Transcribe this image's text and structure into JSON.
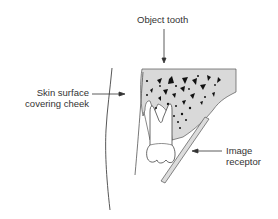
{
  "diagram": {
    "labels": {
      "object_tooth": "Object tooth",
      "skin_surface_line1": "Skin surface",
      "skin_surface_line2": "covering cheek",
      "image_receptor_line1": "Image",
      "image_receptor_line2": "receptor"
    },
    "colors": {
      "line": "#444444",
      "bone_fill": "#d9d9d9",
      "trabecular_dots": "#111111",
      "tooth_fill": "#ffffff",
      "receptor_fill": "#dcdcdc",
      "text": "#333333"
    }
  }
}
